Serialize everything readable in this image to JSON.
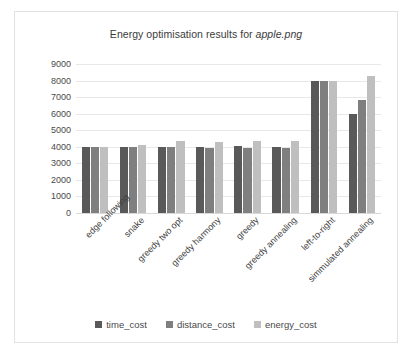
{
  "chart_data": {
    "type": "bar",
    "title": "Energy optimisation results for apple.png",
    "title_plain": "Energy optimisation results for ",
    "title_italic": "apple.png",
    "xlabel": "",
    "ylabel": "",
    "ylim": [
      0,
      9000
    ],
    "ytick_step": 1000,
    "yticks": [
      "0",
      "1000",
      "2000",
      "3000",
      "4000",
      "5000",
      "6000",
      "7000",
      "8000",
      "9000"
    ],
    "grid": true,
    "legend_position": "bottom",
    "categories": [
      "edge following",
      "snake",
      "greedy two opt",
      "greedy harmony",
      "greedy",
      "greedy annealing",
      "left-to-right",
      "simmulated annealing"
    ],
    "series": [
      {
        "name": "time_cost",
        "color": "#595959",
        "values": [
          4000,
          4000,
          4000,
          4000,
          4050,
          4000,
          8000,
          6000
        ]
      },
      {
        "name": "distance_cost",
        "color": "#7f7f7f",
        "values": [
          4000,
          4000,
          4000,
          3950,
          3900,
          3900,
          8000,
          6800
        ]
      },
      {
        "name": "energy_cost",
        "color": "#bfbfbf",
        "values": [
          4000,
          4100,
          4350,
          4300,
          4350,
          4350,
          8000,
          8300
        ]
      }
    ]
  }
}
